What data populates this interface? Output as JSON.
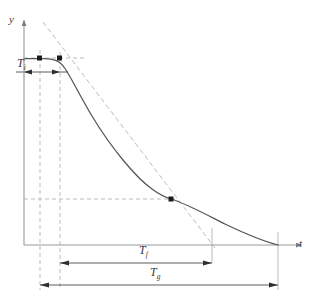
{
  "figure": {
    "name": "decay-curve-timing-diagram",
    "background_color": "#ffffff",
    "width": 315,
    "height": 304
  },
  "axes": {
    "y_label": "y",
    "t_label": "t",
    "origin": {
      "x": 24,
      "y": 245
    },
    "y_axis_top": {
      "x": 24,
      "y": 18
    },
    "t_axis_right": {
      "x": 300,
      "y": 245
    },
    "color": "#9a9a9a"
  },
  "curve": {
    "color": "#555555",
    "description": "flat plateau then sigmoidal decay to the t-axis",
    "points": [
      {
        "x": 24,
        "y": 58
      },
      {
        "x": 40,
        "y": 58
      },
      {
        "x": 52,
        "y": 59
      },
      {
        "x": 60,
        "y": 62
      },
      {
        "x": 66,
        "y": 69
      },
      {
        "x": 72,
        "y": 80
      },
      {
        "x": 90,
        "y": 112
      },
      {
        "x": 120,
        "y": 155
      },
      {
        "x": 150,
        "y": 186
      },
      {
        "x": 171,
        "y": 199
      },
      {
        "x": 200,
        "y": 212
      },
      {
        "x": 240,
        "y": 231
      },
      {
        "x": 278,
        "y": 245
      }
    ]
  },
  "markers": [
    {
      "name": "plateau-point",
      "x": 40,
      "y": 58
    },
    {
      "name": "tangent-point",
      "x": 60,
      "y": 58
    },
    {
      "name": "inflection-point",
      "x": 171,
      "y": 199
    }
  ],
  "guides": {
    "color": "#b9b9b9",
    "vertical_lines": [
      {
        "name": "guide-vertical-plateau",
        "x": 40,
        "y1": 50,
        "y2": 290
      },
      {
        "name": "guide-vertical-tangent",
        "x": 60,
        "y1": 52,
        "y2": 290
      },
      {
        "name": "guide-vertical-fall-end",
        "x": 212,
        "y1": 228,
        "y2": 263
      },
      {
        "name": "guide-vertical-curve-end",
        "x": 278,
        "y1": 232,
        "y2": 290
      }
    ],
    "horizontal_lines": [
      {
        "name": "guide-horizontal-plateau",
        "x1": 24,
        "x2": 86,
        "y": 58
      },
      {
        "name": "guide-horizontal-inflection",
        "x1": 24,
        "x2": 176,
        "y": 199
      }
    ],
    "tangent_line": {
      "name": "tangent-construction-line",
      "x1": 43,
      "y1": 22,
      "x2": 215,
      "y2": 248
    }
  },
  "dimensions": [
    {
      "name": "dimension-Ti",
      "label": "T",
      "subscript": "i",
      "y": 72,
      "x_start": 24,
      "x_end": 60
    },
    {
      "name": "dimension-Tf",
      "label": "T",
      "subscript": "f",
      "y": 263,
      "x_start": 60,
      "x_end": 212
    },
    {
      "name": "dimension-Tg",
      "label": "T",
      "subscript": "g",
      "y": 285,
      "x_start": 40,
      "x_end": 278
    }
  ]
}
